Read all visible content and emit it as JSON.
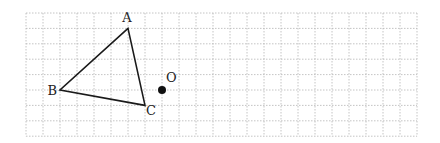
{
  "figure": {
    "type": "grid-geometry",
    "grid": {
      "left": 26,
      "top": 13,
      "cols": 23,
      "rows": 8,
      "cell_w": 17.0,
      "cell_h": 15.4,
      "line_color": "#b5b5b5",
      "style": "dotted"
    },
    "triangle": {
      "vertices": [
        "A",
        "B",
        "C"
      ],
      "stroke": "#1a1a1a"
    },
    "points": {
      "A": {
        "label": "A",
        "col": 6,
        "row": 1
      },
      "B": {
        "label": "B",
        "col": 2,
        "row": 5
      },
      "C": {
        "label": "C",
        "col": 7,
        "row": 6
      },
      "O": {
        "label": "O",
        "col": 8,
        "row": 5
      }
    }
  }
}
